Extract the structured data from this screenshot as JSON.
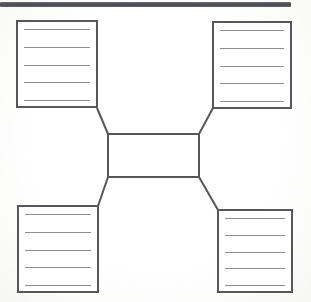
{
  "document": {
    "type": "graphic-organizer-worksheet",
    "title": "",
    "description": "Blank four-corner concept map organizer with a central box connected by diagonal lines to four lined note boxes"
  },
  "top_bar": {
    "name": "scan-edge-bar",
    "color": "#4a4b4f",
    "label": ""
  },
  "colors": {
    "box_border": "#56575b",
    "rule_line": "#8d8e92",
    "connector": "#56575b",
    "page_background": "#fdfdfd"
  },
  "center": {
    "label": "",
    "placeholder": ""
  },
  "boxes": [
    {
      "id": "top-left",
      "label": "",
      "lines": [
        "",
        "",
        "",
        "",
        ""
      ]
    },
    {
      "id": "top-right",
      "label": "",
      "lines": [
        "",
        "",
        "",
        "",
        ""
      ]
    },
    {
      "id": "bottom-left",
      "label": "",
      "lines": [
        "",
        "",
        "",
        "",
        ""
      ]
    },
    {
      "id": "bottom-right",
      "label": "",
      "lines": [
        "",
        "",
        "",
        "",
        ""
      ]
    }
  ],
  "connectors": [
    {
      "id": "top-left-to-center",
      "from": "top-left",
      "to": "center"
    },
    {
      "id": "top-right-to-center",
      "from": "top-right",
      "to": "center"
    },
    {
      "id": "bottom-left-to-center",
      "from": "bottom-left",
      "to": "center"
    },
    {
      "id": "bottom-right-to-center",
      "from": "bottom-right",
      "to": "center"
    }
  ]
}
